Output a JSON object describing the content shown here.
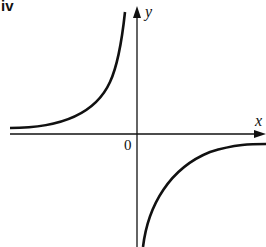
{
  "panel_label": "iv",
  "axes": {
    "x_label": "x",
    "y_label": "y",
    "origin_label": "0"
  },
  "curves": [
    {
      "name": "upper-left branch",
      "quadrant": "II",
      "description": "rises steeply approaching y-axis from left, asymptotic to a line slightly above x-axis"
    },
    {
      "name": "lower-right branch",
      "quadrant": "IV",
      "description": "rises from far below near y-axis, flattening toward a line slightly below x-axis"
    }
  ],
  "colors": {
    "stroke": "#111111",
    "background": "#ffffff"
  }
}
